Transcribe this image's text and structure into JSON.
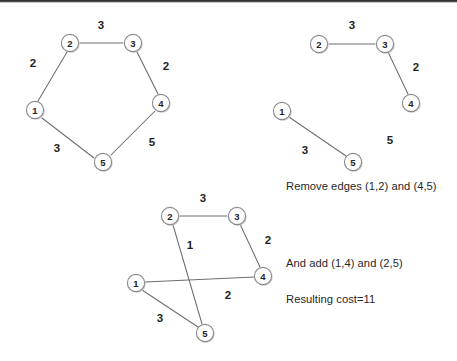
{
  "figure": {
    "background_color": "#ffffff",
    "node_stroke_color": "#8a8a90",
    "edge_stroke_color": "#6e6e72",
    "text_color": "#27272a",
    "width": 457,
    "height": 361
  },
  "graphs": [
    {
      "id": "graph-original-cycle",
      "name": "original-tour",
      "nodes": [
        {
          "label": "1",
          "x": 35,
          "y": 110
        },
        {
          "label": "2",
          "x": 70,
          "y": 43
        },
        {
          "label": "3",
          "x": 133,
          "y": 43
        },
        {
          "label": "4",
          "x": 161,
          "y": 103
        },
        {
          "label": "5",
          "x": 103,
          "y": 162
        }
      ],
      "edges": [
        {
          "from": "1",
          "to": "2",
          "weight": "2",
          "label_x": 33,
          "label_y": 63
        },
        {
          "from": "2",
          "to": "3",
          "weight": "3",
          "label_x": 101,
          "label_y": 25
        },
        {
          "from": "3",
          "to": "4",
          "weight": "2",
          "label_x": 166,
          "label_y": 66
        },
        {
          "from": "4",
          "to": "5",
          "weight": "5",
          "label_x": 152,
          "label_y": 142
        },
        {
          "from": "5",
          "to": "1",
          "weight": "3",
          "label_x": 57,
          "label_y": 148
        }
      ]
    },
    {
      "id": "graph-edges-removed",
      "name": "after-removal",
      "nodes": [
        {
          "label": "1",
          "x": 282,
          "y": 111
        },
        {
          "label": "2",
          "x": 319,
          "y": 44
        },
        {
          "label": "3",
          "x": 385,
          "y": 44
        },
        {
          "label": "4",
          "x": 411,
          "y": 103
        },
        {
          "label": "5",
          "x": 353,
          "y": 162
        }
      ],
      "edges": [
        {
          "from": "2",
          "to": "3",
          "weight": "3",
          "label_x": 352,
          "label_y": 25
        },
        {
          "from": "3",
          "to": "4",
          "weight": "2",
          "label_x": 416,
          "label_y": 67
        },
        {
          "from": "1",
          "to": "5",
          "weight": "3",
          "label_x": 305,
          "label_y": 150
        }
      ],
      "orphan_labels": [
        {
          "text": "5",
          "x": 390,
          "y": 140
        }
      ]
    },
    {
      "id": "graph-reconnected",
      "name": "after-reconnection",
      "nodes": [
        {
          "label": "1",
          "x": 136,
          "y": 283
        },
        {
          "label": "2",
          "x": 170,
          "y": 216
        },
        {
          "label": "3",
          "x": 237,
          "y": 216
        },
        {
          "label": "4",
          "x": 263,
          "y": 276
        },
        {
          "label": "5",
          "x": 205,
          "y": 333
        }
      ],
      "edges": [
        {
          "from": "2",
          "to": "3",
          "weight": "3",
          "label_x": 203,
          "label_y": 198
        },
        {
          "from": "3",
          "to": "4",
          "weight": "2",
          "label_x": 268,
          "label_y": 240
        },
        {
          "from": "2",
          "to": "5",
          "weight": "1",
          "label_x": 190,
          "label_y": 245
        },
        {
          "from": "1",
          "to": "4",
          "weight": "2",
          "label_x": 228,
          "label_y": 295
        },
        {
          "from": "1",
          "to": "5",
          "weight": "3",
          "label_x": 160,
          "label_y": 318
        }
      ]
    }
  ],
  "captions": [
    {
      "id": "caption-remove",
      "text": "Remove edges (1,2) and (4,5)",
      "x": 286,
      "y": 180
    },
    {
      "id": "caption-add",
      "text": "And add (1,4) and (2,5)",
      "x": 286,
      "y": 257
    },
    {
      "id": "caption-cost",
      "text": "Resulting cost=11",
      "x": 286,
      "y": 293
    }
  ]
}
